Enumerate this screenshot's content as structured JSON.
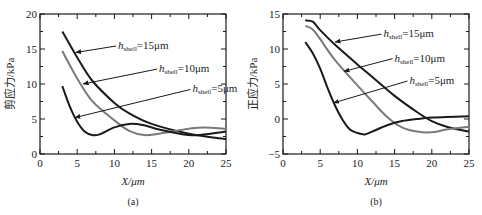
{
  "chart_data": [
    {
      "type": "line",
      "panel_label": "(a)",
      "title": "",
      "xlabel": "X/μm",
      "ylabel": "剪应力/kPa",
      "xlim": [
        0,
        25
      ],
      "ylim": [
        0,
        20
      ],
      "xticks": [
        0,
        5,
        10,
        15,
        20,
        25
      ],
      "yticks": [
        0,
        5,
        10,
        15,
        20
      ],
      "grid": false,
      "legend_position": "inline annotations with arrows",
      "series": [
        {
          "name": "h_shell=15μm",
          "color": "#1a1a1a",
          "x": [
            3,
            5,
            7,
            10,
            12,
            15,
            20,
            25
          ],
          "y": [
            17.5,
            13.8,
            10.5,
            7.3,
            5.8,
            4.3,
            2.9,
            2.1
          ]
        },
        {
          "name": "h_shell=10μm",
          "color": "#7a7a7a",
          "x": [
            3,
            5,
            7,
            10,
            12,
            14,
            16,
            20,
            22,
            25
          ],
          "y": [
            14.7,
            10.8,
            7.6,
            4.8,
            3.3,
            2.7,
            2.9,
            3.6,
            3.8,
            3.6
          ]
        },
        {
          "name": "h_shell=5μm",
          "color": "#1a1a1a",
          "x": [
            3,
            4,
            5,
            6,
            7,
            8,
            10,
            12,
            14,
            16,
            20,
            22,
            25
          ],
          "y": [
            9.7,
            6.8,
            4.6,
            3.2,
            2.7,
            2.8,
            3.8,
            4.3,
            4.1,
            3.5,
            2.7,
            2.8,
            3.2
          ]
        }
      ],
      "annotations": [
        {
          "text_main": "h",
          "text_sub": "shell",
          "text_rest": "=15μm",
          "text_x": 10.5,
          "text_y": 15.0,
          "arrow_to": [
            4.8,
            14.5
          ]
        },
        {
          "text_main": "h",
          "text_sub": "shell",
          "text_rest": "=10μm",
          "text_x": 16.0,
          "text_y": 11.7,
          "arrow_to": [
            5.8,
            10.0
          ]
        },
        {
          "text_main": "h",
          "text_sub": "shell",
          "text_rest": "=5μm",
          "text_x": 20.5,
          "text_y": 8.8,
          "arrow_to": [
            4.7,
            5.2
          ]
        }
      ]
    },
    {
      "type": "line",
      "panel_label": "(b)",
      "title": "",
      "xlabel": "X/μm",
      "ylabel": "正应力/kPa",
      "xlim": [
        0,
        25
      ],
      "ylim": [
        -5,
        15
      ],
      "xticks": [
        0,
        5,
        10,
        15,
        20,
        25
      ],
      "yticks": [
        -5,
        0,
        5,
        10,
        15
      ],
      "grid": false,
      "legend_position": "inline annotations with arrows",
      "series": [
        {
          "name": "h_shell=15μm",
          "color": "#1a1a1a",
          "x": [
            3,
            4,
            5,
            7,
            10,
            12,
            15,
            18,
            20,
            22,
            25
          ],
          "y": [
            14.1,
            13.9,
            12.7,
            10.6,
            7.8,
            6.0,
            3.3,
            1.0,
            -0.3,
            -1.1,
            -1.8
          ]
        },
        {
          "name": "h_shell=10μm",
          "color": "#7a7a7a",
          "x": [
            3,
            4,
            5,
            7,
            10,
            12,
            14,
            16,
            18,
            20,
            22,
            25
          ],
          "y": [
            13.3,
            12.8,
            11.4,
            8.4,
            4.8,
            2.5,
            0.3,
            -1.2,
            -1.8,
            -1.9,
            -1.5,
            -1.1
          ]
        },
        {
          "name": "h_shell=5μm",
          "color": "#1a1a1a",
          "x": [
            3,
            4,
            5,
            6,
            7,
            8,
            9,
            10,
            11,
            12,
            14,
            16,
            18,
            20,
            25
          ],
          "y": [
            11.0,
            9.4,
            7.2,
            4.4,
            1.9,
            -0.1,
            -1.5,
            -2.0,
            -2.2,
            -1.8,
            -0.9,
            -0.3,
            0.0,
            0.2,
            0.4
          ]
        }
      ],
      "annotations": [
        {
          "text_main": "h",
          "text_sub": "shell",
          "text_rest": "=15μm",
          "text_x": 13.5,
          "text_y": 11.7,
          "arrow_to": [
            7.0,
            11.0
          ]
        },
        {
          "text_main": "h",
          "text_sub": "shell",
          "text_rest": "=10μm",
          "text_x": 15.0,
          "text_y": 8.2,
          "arrow_to": [
            8.2,
            6.8
          ]
        },
        {
          "text_main": "h",
          "text_sub": "shell",
          "text_rest": "=5μm",
          "text_x": 17.0,
          "text_y": 5.0,
          "arrow_to": [
            6.8,
            2.3
          ]
        }
      ]
    }
  ],
  "layout": {
    "panels": [
      {
        "left": 40,
        "right": 226,
        "top": 14,
        "bottom": 154
      },
      {
        "left": 283,
        "right": 469,
        "top": 14,
        "bottom": 154
      }
    ]
  }
}
